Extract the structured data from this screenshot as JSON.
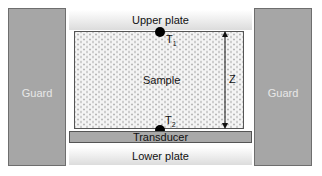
{
  "diagram": {
    "guards": {
      "left": "Guard",
      "right": "Guard"
    },
    "upper_plate": "Upper plate",
    "lower_plate": "Lower plate",
    "sample": "Sample",
    "transducer": "Transducer",
    "sensors": [
      {
        "label": "T",
        "subscript": "1",
        "position": "top"
      },
      {
        "label": "T",
        "subscript": "2",
        "position": "bottom"
      }
    ],
    "dimension": {
      "label": "Z",
      "direction": "vertical double arrow"
    },
    "colors": {
      "guard": "#a6a6a6",
      "transducer": "#a9a9a9",
      "sensor": "#000000",
      "sample_fill": "#f4f4f4"
    }
  }
}
